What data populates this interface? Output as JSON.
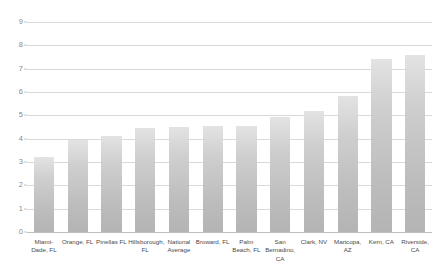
{
  "chart_data": {
    "type": "bar",
    "title": "",
    "subtitle": "",
    "xlabel": "",
    "ylabel": "",
    "ylim": [
      0,
      9
    ],
    "yticks": [
      "0",
      "1",
      "2",
      "3",
      "4",
      "5",
      "6",
      "7",
      "8",
      "9"
    ],
    "grid": true,
    "legend": "none",
    "bar_color": "#c6c6c6",
    "gridline_color": "#d9d9d9",
    "categories": [
      "Miami-Dade, FL",
      "Orange, FL",
      "Pinellas FL",
      "Hillsborough, FL",
      "National Average",
      "Broward, FL",
      "Palm Beach, FL",
      "San Bernadino, CA",
      "Clark, NV",
      "Maricopa, AZ",
      "Kern, CA",
      "Riverside, CA"
    ],
    "values": [
      3.2,
      3.95,
      4.1,
      4.45,
      4.5,
      4.55,
      4.55,
      4.95,
      5.2,
      5.85,
      7.4,
      7.6
    ]
  }
}
